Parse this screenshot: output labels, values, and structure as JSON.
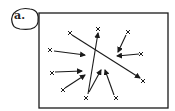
{
  "panel_label": "a.",
  "colors": {
    "stroke": "#1a1a1a",
    "background": "#ffffff"
  },
  "frame": {
    "x": 39,
    "y": 13,
    "w": 129,
    "h": 95
  },
  "markers": [
    {
      "x": 70,
      "y": 33
    },
    {
      "x": 98,
      "y": 29
    },
    {
      "x": 128,
      "y": 32
    },
    {
      "x": 50,
      "y": 50
    },
    {
      "x": 141,
      "y": 54
    },
    {
      "x": 52,
      "y": 73
    },
    {
      "x": 143,
      "y": 81
    },
    {
      "x": 63,
      "y": 90
    },
    {
      "x": 86,
      "y": 98
    },
    {
      "x": 116,
      "y": 98
    }
  ],
  "arrows": [
    {
      "x1": 72,
      "y1": 35,
      "x2": 140,
      "y2": 78
    },
    {
      "x1": 88,
      "y1": 94,
      "x2": 98,
      "y2": 33
    },
    {
      "x1": 54,
      "y1": 51,
      "x2": 85,
      "y2": 55
    },
    {
      "x1": 55,
      "y1": 72,
      "x2": 82,
      "y2": 71
    },
    {
      "x1": 65,
      "y1": 88,
      "x2": 85,
      "y2": 75
    },
    {
      "x1": 126,
      "y1": 35,
      "x2": 118,
      "y2": 52
    },
    {
      "x1": 139,
      "y1": 54,
      "x2": 117,
      "y2": 56
    },
    {
      "x1": 89,
      "y1": 92,
      "x2": 101,
      "y2": 70
    },
    {
      "x1": 114,
      "y1": 95,
      "x2": 105,
      "y2": 70
    }
  ]
}
